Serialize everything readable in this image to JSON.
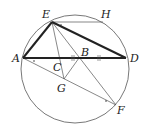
{
  "figure": {
    "type": "geometry",
    "circle": {
      "cx": 75,
      "cy": 69,
      "r": 54
    },
    "points": {
      "A": {
        "x": 23,
        "y": 58
      },
      "B": {
        "x": 79,
        "y": 58
      },
      "C": {
        "x": 58,
        "y": 58
      },
      "D": {
        "x": 126,
        "y": 58
      },
      "E": {
        "x": 52,
        "y": 22
      },
      "F": {
        "x": 116,
        "y": 105
      },
      "G": {
        "x": 64,
        "y": 79
      },
      "H": {
        "x": 103,
        "y": 22
      }
    },
    "labels": {
      "A": "A",
      "B": "B",
      "C": "C",
      "D": "D",
      "E": "E",
      "F": "F",
      "G": "G",
      "H": "H"
    },
    "bold_segments": [
      [
        "A",
        "E"
      ],
      [
        "E",
        "D"
      ],
      [
        "A",
        "D"
      ]
    ],
    "thin_segments": [
      [
        "E",
        "H"
      ],
      [
        "E",
        "G"
      ],
      [
        "E",
        "F"
      ],
      [
        "A",
        "F"
      ],
      [
        "G",
        "B"
      ]
    ],
    "colors": {
      "stroke": "#222222",
      "thin": "#555555"
    }
  }
}
